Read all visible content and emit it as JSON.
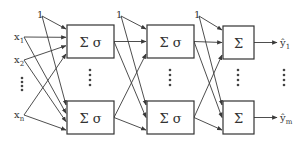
{
  "diagram": {
    "title": "",
    "type": "feedforward neural network",
    "colors": {
      "line": "#3a3a3a",
      "box_stroke": "#333333",
      "background": "#ffffff"
    },
    "inputs": [
      {
        "label": "x",
        "sub": "1",
        "x": 14,
        "y": 40
      },
      {
        "label": "x",
        "sub": "2",
        "x": 14,
        "y": 63
      },
      {
        "label": "x",
        "sub": "n",
        "x": 14,
        "y": 118
      }
    ],
    "input_ellipsis": {
      "x": 22,
      "ys": [
        78,
        82,
        86,
        90
      ]
    },
    "biases": [
      {
        "label": "1",
        "x": 37,
        "y": 18,
        "layer": 0
      },
      {
        "label": "1",
        "x": 116,
        "y": 18,
        "layer": 1
      },
      {
        "label": "1",
        "x": 194,
        "y": 18,
        "layer": 2
      }
    ],
    "layers": [
      {
        "name": "hidden-layer-1",
        "x": 67,
        "w": 47,
        "nodes": [
          {
            "label": "Σ σ",
            "y": 25,
            "h": 33
          },
          {
            "label": "Σ σ",
            "y": 101,
            "h": 33
          }
        ],
        "ellipsis": {
          "x": 90,
          "ys": [
            70,
            75,
            80,
            85
          ]
        }
      },
      {
        "name": "hidden-layer-2",
        "x": 147,
        "w": 47,
        "nodes": [
          {
            "label": "Σ σ",
            "y": 25,
            "h": 33
          },
          {
            "label": "Σ σ",
            "y": 101,
            "h": 33
          }
        ],
        "ellipsis": {
          "x": 170,
          "ys": [
            70,
            75,
            80,
            85
          ]
        }
      },
      {
        "name": "output-layer",
        "x": 223,
        "w": 31,
        "nodes": [
          {
            "label": "Σ",
            "y": 26,
            "h": 33
          },
          {
            "label": "Σ",
            "y": 101,
            "h": 33
          }
        ],
        "ellipsis": {
          "x": 238,
          "ys": [
            70,
            75,
            80,
            85
          ]
        }
      }
    ],
    "outputs": [
      {
        "label": "ŷ",
        "sub": "1",
        "x": 280,
        "y": 46
      },
      {
        "label": "ŷ",
        "sub": "m",
        "x": 280,
        "y": 121
      }
    ],
    "output_ellipsis": {
      "x": 284,
      "ys": [
        70,
        75,
        80,
        85
      ]
    }
  }
}
